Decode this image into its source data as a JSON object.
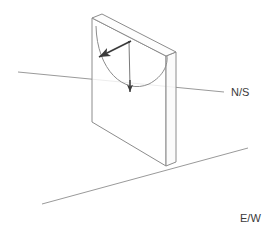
{
  "diagram": {
    "canvas": {
      "width": 270,
      "height": 232,
      "background": "#ffffff"
    },
    "labels": {
      "ns": "N/S",
      "ew": "E/W"
    },
    "colors": {
      "ground_line": "#9a9a9a",
      "plane_outline": "#8c8c8c",
      "plane_fill": "#ffffff",
      "arc": "#8c8c8c",
      "pendulum_rod": "#7a7a7a",
      "arrow": "#3a3a3a",
      "label_text": "#3a3a3a"
    },
    "elements": {
      "ground_ns_axis": "north-south ground reference line running lower-left to upper-right",
      "ground_ew_axis": "east-west ground reference line running lower-left to upper-right",
      "vertical_plane": "transparent vertical slab showing the pendulum's swing plane",
      "swing_arc": "arc traced by the pendulum bob inside the plane",
      "velocity_arrow": "bold arrow at the pivot indicating swing direction",
      "gravity_arrow": "vertical arrow from pivot pointing down"
    },
    "geometry": {
      "plane_front": "92,18 92,122 166,166 166,56",
      "plane_side": "166,56 176,52 176,162 166,166",
      "plane_top": "92,18 102,14 176,52 166,56",
      "arc_path": "M 96,26 C 98,74 130,96 152,82 C 166,72 168,62 167,56",
      "pivot": {
        "x": 129,
        "y": 42
      },
      "velocity_arrow_tip": {
        "x": 97,
        "y": 58
      },
      "gravity_arrow_tip": {
        "x": 130,
        "y": 92
      },
      "ns_line": {
        "x1": 18,
        "y1": 72,
        "x2": 224,
        "y2": 92
      },
      "ew_line": {
        "x1": 42,
        "y1": 204,
        "x2": 248,
        "y2": 148
      },
      "ns_label_pos": {
        "x": 231,
        "y": 96
      },
      "ew_label_pos": {
        "x": 240,
        "y": 222
      }
    }
  }
}
